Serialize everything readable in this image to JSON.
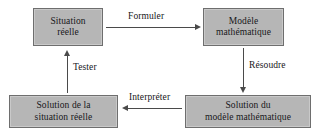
{
  "diagram": {
    "language": "fr",
    "colors": {
      "node_fill": "#b6b6b6",
      "node_border": "#6e6e6e",
      "arrow": "#4a4a4a",
      "text": "#17171a",
      "background": "#ffffff"
    },
    "nodes": [
      {
        "id": "situation-reelle",
        "lines": [
          "Situation",
          "réelle"
        ],
        "position": "top-left"
      },
      {
        "id": "modele-mathematique",
        "lines": [
          "Modèle",
          "mathématique"
        ],
        "position": "top-right"
      },
      {
        "id": "solution-modele-mathematique",
        "lines": [
          "Solution du",
          "modèle mathématique"
        ],
        "position": "bottom-right"
      },
      {
        "id": "solution-situation-reelle",
        "lines": [
          "Solution de la",
          "situation réelle"
        ],
        "position": "bottom-left"
      }
    ],
    "edges": [
      {
        "id": "formuler",
        "label": "Formuler",
        "from": "situation-reelle",
        "to": "modele-mathematique",
        "direction": "right"
      },
      {
        "id": "resoudre",
        "label": "Résoudre",
        "from": "modele-mathematique",
        "to": "solution-modele-mathematique",
        "direction": "down"
      },
      {
        "id": "interpreter",
        "label": "Interpréter",
        "from": "solution-modele-mathematique",
        "to": "solution-situation-reelle",
        "direction": "left"
      },
      {
        "id": "tester",
        "label": "Tester",
        "from": "solution-situation-reelle",
        "to": "situation-reelle",
        "direction": "up"
      }
    ]
  }
}
